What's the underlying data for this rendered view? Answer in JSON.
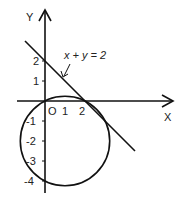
{
  "diagram": {
    "axes": {
      "x_label": "X",
      "y_label": "Y",
      "origin_label": "O",
      "x_ticks": [
        "1",
        "2"
      ],
      "y_ticks_positive": [
        "1",
        "2"
      ],
      "y_ticks_negative": [
        "-1",
        "-2",
        "-3",
        "-4"
      ]
    },
    "line": {
      "equation_label": "x + y = 2"
    },
    "circle": {
      "center": [
        1,
        -2
      ],
      "radius_squared": 5
    },
    "colors": {
      "stroke": "#111111",
      "background": "#ffffff"
    }
  }
}
